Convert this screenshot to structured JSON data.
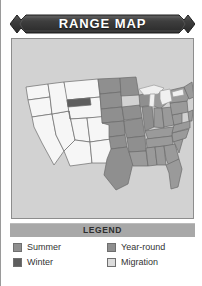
{
  "card": {
    "title": "RANGE MAP",
    "title_bar_color": "#3a3a3a",
    "panel_bg_color": "#d2d2d2",
    "panel_border_color": "#8d8d8d"
  },
  "legend": {
    "header": "LEGEND",
    "header_bg_color": "#a8a8a8",
    "bird_icon": "flying-bird-icon",
    "bird_color": "#cfcfcf",
    "items": [
      {
        "label": "Summer",
        "color": "#8f8f8f",
        "column": "left"
      },
      {
        "label": "Winter",
        "color": "#5e5e5e",
        "column": "left"
      },
      {
        "label": "Year-round",
        "color": "#8f8f8f",
        "column": "right"
      },
      {
        "label": "Migration",
        "color": "#dcdcdc",
        "column": "right"
      }
    ]
  },
  "map": {
    "region": "United States",
    "water_color": "#d2d2d2",
    "outline_color": "#6a6a6a",
    "fills": {
      "summer": "#8f8f8f",
      "winter": "#5e5e5e",
      "year_round": "#9a9a9a",
      "migration": "#e8e8e8",
      "none": "#f4f4f4"
    },
    "areas": [
      {
        "name": "pacific-northwest",
        "category": "none"
      },
      {
        "name": "california",
        "category": "none"
      },
      {
        "name": "great-basin",
        "category": "none"
      },
      {
        "name": "northern-rockies",
        "category": "winter"
      },
      {
        "name": "southwest",
        "category": "none"
      },
      {
        "name": "great-plains",
        "category": "summer"
      },
      {
        "name": "upper-midwest",
        "category": "summer"
      },
      {
        "name": "great-lakes",
        "category": "migration"
      },
      {
        "name": "northeast",
        "category": "year_round"
      },
      {
        "name": "mid-atlantic",
        "category": "year_round"
      },
      {
        "name": "southeast",
        "category": "year_round"
      },
      {
        "name": "florida",
        "category": "year_round"
      },
      {
        "name": "gulf-coast",
        "category": "year_round"
      }
    ]
  }
}
